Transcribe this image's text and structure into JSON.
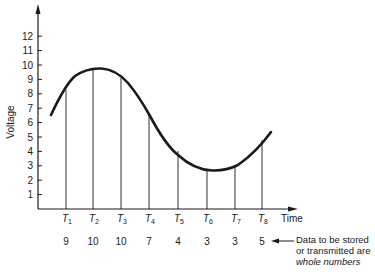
{
  "chart_data": {
    "type": "line",
    "title": "",
    "xlabel": "Time",
    "ylabel": "Voltage",
    "yticks": [
      1,
      2,
      3,
      4,
      5,
      6,
      7,
      8,
      9,
      10,
      11,
      12
    ],
    "ylim": [
      0,
      13
    ],
    "grid": false,
    "sample_points": [
      {
        "label": "T1",
        "base": "T",
        "sub": "1",
        "value": 9
      },
      {
        "label": "T2",
        "base": "T",
        "sub": "2",
        "value": 10
      },
      {
        "label": "T3",
        "base": "T",
        "sub": "3",
        "value": 10
      },
      {
        "label": "T4",
        "base": "T",
        "sub": "4",
        "value": 7
      },
      {
        "label": "T5",
        "base": "T",
        "sub": "5",
        "value": 4
      },
      {
        "label": "T6",
        "base": "T",
        "sub": "6",
        "value": 3
      },
      {
        "label": "T7",
        "base": "T",
        "sub": "7",
        "value": 3
      },
      {
        "label": "T8",
        "base": "T",
        "sub": "8",
        "value": 5
      }
    ],
    "curve_description": "Continuous analog voltage waveform starting near 7.5, rising to a peak ~10.5 between T2 and T3, falling to a trough ~3.5 near T6, then rising to ~6 after T8"
  },
  "axes": {
    "x_label": "Time",
    "y_label": "Voltage"
  },
  "annotation": {
    "line1": "Data to be stored",
    "line2": "or transmitted are",
    "line3": "whole numbers"
  },
  "colors": {
    "ink": "#1a1a1a",
    "background": "#ffffff"
  }
}
